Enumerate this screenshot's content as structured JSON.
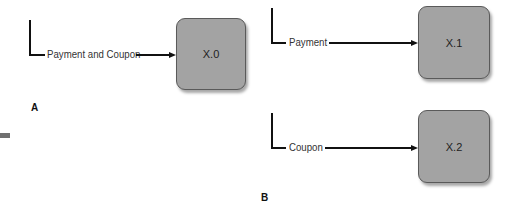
{
  "panels": {
    "A": {
      "label": "A",
      "flows": [
        {
          "label": "Payment and Coupon",
          "target": "X.0"
        }
      ]
    },
    "B": {
      "label": "B",
      "flows": [
        {
          "label": "Payment",
          "target": "X.1"
        },
        {
          "label": "Coupon",
          "target": "X.2"
        }
      ]
    }
  },
  "nodes": {
    "x0": "X.0",
    "x1": "X.1",
    "x2": "X.2"
  },
  "colors": {
    "node_fill": "#a3a3a3",
    "node_border": "#5a5a5a",
    "line": "#111111"
  }
}
